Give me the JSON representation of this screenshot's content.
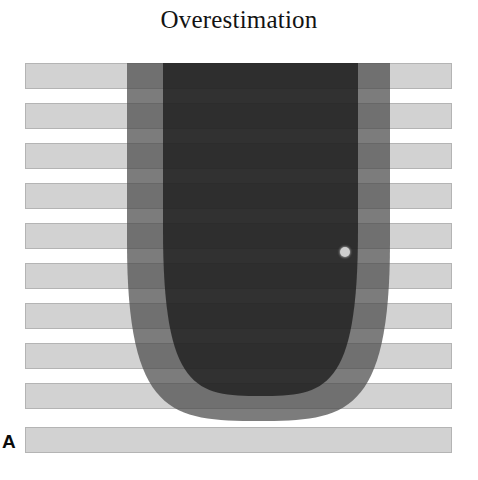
{
  "figure": {
    "title": "Overestimation",
    "panel_label": "A",
    "width": 478,
    "height": 480,
    "background_color": "#ffffff"
  },
  "chart_data": {
    "type": "bar",
    "title": "Overestimation",
    "orientation": "horizontal",
    "xlabel": "",
    "ylabel": "",
    "grid": false,
    "legend": null,
    "categories": [
      "bar-1",
      "bar-2",
      "bar-3",
      "bar-4",
      "bar-5",
      "bar-6",
      "bar-7",
      "bar-8",
      "bar-9",
      "bar-10"
    ],
    "values": [
      427,
      427,
      427,
      427,
      427,
      427,
      427,
      427,
      427,
      427
    ],
    "bar_color": "#d2d2d2",
    "bar_border_color": "#b4b4b4",
    "bars": [
      {
        "name": "bar-1",
        "x": 25,
        "y": 63,
        "width": 427,
        "height": 26
      },
      {
        "name": "bar-2",
        "x": 25,
        "y": 103,
        "width": 427,
        "height": 26
      },
      {
        "name": "bar-3",
        "x": 25,
        "y": 143,
        "width": 427,
        "height": 26
      },
      {
        "name": "bar-4",
        "x": 25,
        "y": 183,
        "width": 427,
        "height": 26
      },
      {
        "name": "bar-5",
        "x": 25,
        "y": 223,
        "width": 427,
        "height": 26
      },
      {
        "name": "bar-6",
        "x": 25,
        "y": 263,
        "width": 427,
        "height": 26
      },
      {
        "name": "bar-7",
        "x": 25,
        "y": 303,
        "width": 427,
        "height": 26
      },
      {
        "name": "bar-8",
        "x": 25,
        "y": 343,
        "width": 427,
        "height": 26
      },
      {
        "name": "bar-9",
        "x": 25,
        "y": 383,
        "width": 427,
        "height": 26
      },
      {
        "name": "bar-10",
        "x": 25,
        "y": 427,
        "width": 427,
        "height": 26
      }
    ],
    "overlays": [
      {
        "name": "outer-parabola",
        "shape": "u-shape",
        "color": "#4a4a4a",
        "opacity": 0.72,
        "left": 127,
        "right": 390,
        "top": 63,
        "bottom": 421
      },
      {
        "name": "inner-parabola",
        "shape": "u-shape",
        "color": "#1c1c1c",
        "opacity": 0.78,
        "left": 163,
        "right": 358,
        "top": 63,
        "bottom": 396
      }
    ],
    "markers": [
      {
        "name": "dot-marker",
        "shape": "circle",
        "x": 345,
        "y": 252,
        "radius": 5,
        "color": "#cfcfcf"
      }
    ]
  }
}
